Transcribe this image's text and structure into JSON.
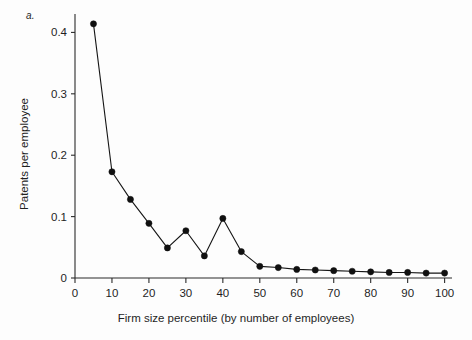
{
  "figure": {
    "panel_label": "a.",
    "background_color": "#fdfdfd",
    "ink_color": "#101010"
  },
  "chart_data": {
    "type": "line",
    "title": "",
    "subtitle": "",
    "xlabel": "Firm size percentile (by number of employees)",
    "ylabel": "Patents per employee",
    "xlim": [
      0,
      102
    ],
    "ylim": [
      0,
      0.43
    ],
    "xticks": [
      0,
      10,
      20,
      30,
      40,
      50,
      60,
      70,
      80,
      90,
      100
    ],
    "xtick_labels": [
      "0",
      "10",
      "20",
      "30",
      "40",
      "50",
      "60",
      "70",
      "80",
      "90",
      "100"
    ],
    "yticks": [
      0,
      0.1,
      0.2,
      0.3,
      0.4
    ],
    "ytick_labels": [
      "0",
      "0.1",
      "0.2",
      "0.3",
      "0.4"
    ],
    "grid": false,
    "legend": null,
    "legend_position": "none",
    "marker": "filled-circle",
    "x": [
      5,
      10,
      15,
      20,
      25,
      30,
      35,
      40,
      45,
      50,
      55,
      60,
      65,
      70,
      75,
      80,
      85,
      90,
      95,
      100
    ],
    "values": [
      0.414,
      0.173,
      0.128,
      0.089,
      0.049,
      0.077,
      0.036,
      0.097,
      0.043,
      0.019,
      0.017,
      0.014,
      0.013,
      0.012,
      0.011,
      0.01,
      0.009,
      0.009,
      0.008,
      0.008
    ],
    "series": [
      {
        "name": "Patents per employee",
        "values": [
          0.414,
          0.173,
          0.128,
          0.089,
          0.049,
          0.077,
          0.036,
          0.097,
          0.043,
          0.019,
          0.017,
          0.014,
          0.013,
          0.012,
          0.011,
          0.01,
          0.009,
          0.009,
          0.008,
          0.008
        ]
      }
    ]
  }
}
